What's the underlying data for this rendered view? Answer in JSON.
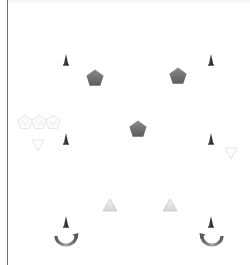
{
  "scene": {
    "width": 250,
    "height": 265,
    "background": "#ffffff",
    "edge_line_color": "#6e6e6e"
  },
  "colors": {
    "cone_dark": "#2e2e2e",
    "cone_light": "#6a6a6a",
    "pentagon_top": "#8a8a8a",
    "pentagon_bottom": "#5c5c5c",
    "ghost_outline": "#e6e6e6",
    "triangle_fill_top": "#f2f2f2",
    "triangle_fill_bottom": "#d6d6d6",
    "triangle_stroke": "#c8c8c8",
    "arc_light": "#a8a8a8",
    "arc_dark": "#5a5a5a"
  },
  "cones": [
    {
      "id": "cone-top-left",
      "x": 66,
      "y": 60
    },
    {
      "id": "cone-top-right",
      "x": 211,
      "y": 60
    },
    {
      "id": "cone-mid-left",
      "x": 66,
      "y": 139
    },
    {
      "id": "cone-mid-right",
      "x": 211,
      "y": 139
    },
    {
      "id": "cone-bottom-left",
      "x": 66,
      "y": 222
    },
    {
      "id": "cone-bottom-right",
      "x": 211,
      "y": 222
    }
  ],
  "pentagons": [
    {
      "id": "pentagon-left",
      "x": 95,
      "y": 78
    },
    {
      "id": "pentagon-right",
      "x": 178,
      "y": 76
    },
    {
      "id": "pentagon-center",
      "x": 138,
      "y": 129
    }
  ],
  "ghost_pentagons": [
    {
      "id": "ghost-pentagon-1",
      "x": 25,
      "y": 122
    },
    {
      "id": "ghost-pentagon-2",
      "x": 39,
      "y": 122
    },
    {
      "id": "ghost-pentagon-3",
      "x": 53,
      "y": 122
    }
  ],
  "ghost_triangles": [
    {
      "id": "ghost-triangle-left",
      "x": 38,
      "y": 145
    },
    {
      "id": "ghost-triangle-right",
      "x": 231,
      "y": 153
    }
  ],
  "triangles": [
    {
      "id": "triangle-left",
      "x": 110,
      "y": 205
    },
    {
      "id": "triangle-right",
      "x": 170,
      "y": 205
    }
  ],
  "arcs": [
    {
      "id": "arc-arrow-left",
      "x": 66,
      "y": 240,
      "mirror": false
    },
    {
      "id": "arc-arrow-right",
      "x": 212,
      "y": 240,
      "mirror": true
    }
  ]
}
